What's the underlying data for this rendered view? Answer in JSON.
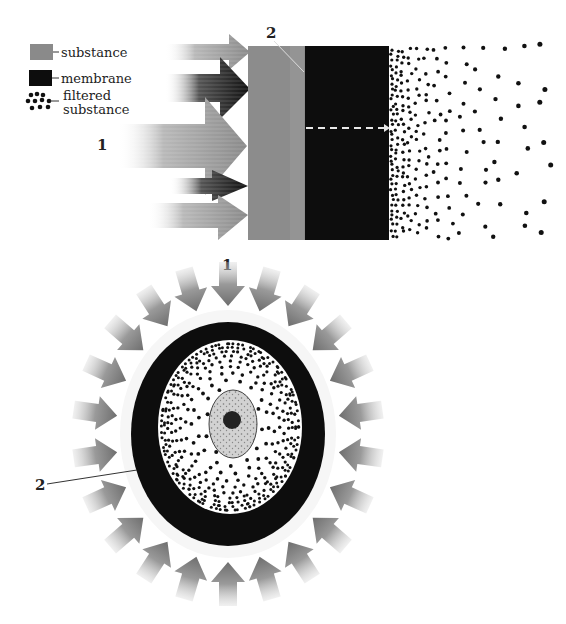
{
  "figure": {
    "type": "scientific-illustration",
    "colors": {
      "background": "#ffffff",
      "substance": "#8c8c8c",
      "substance_light": "#b4b4b4",
      "membrane": "#0d0d0d",
      "filtered_dots": "#111111",
      "nucleus": "#cfcfcf",
      "dashed_arrow": "#e8e8e8"
    }
  },
  "legend": {
    "items": [
      {
        "label": "substance",
        "swatch": "substance"
      },
      {
        "label": "membrane",
        "swatch": "membrane"
      },
      {
        "label_line1": "filtered",
        "label_line2": "substance",
        "swatch": "dots"
      }
    ]
  },
  "panel_top": {
    "label_1": "1",
    "label_2": "2",
    "description": "Arrows of substance pushing against a layer, black membrane, filtered dots diffusing outward"
  },
  "panel_bottom": {
    "label_1": "1",
    "label_2": "2",
    "description": "Cell surrounded by inward arrows, black membrane ring, dotted cytoplasm and central nucleus"
  }
}
